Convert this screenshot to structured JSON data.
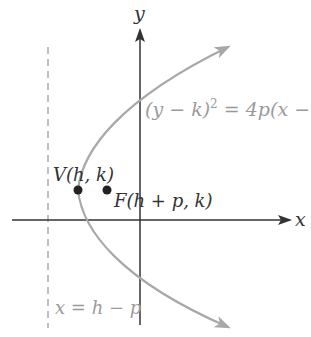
{
  "diagram": {
    "type": "parabola-horizontal-axis",
    "axes": {
      "x_label": "x",
      "y_label": "y"
    },
    "equation": {
      "lhs": "(y − k)",
      "exp": "2",
      "rhs": " = 4p(x − h"
    },
    "vertex": {
      "label": "V(h, k)"
    },
    "focus": {
      "label": "F(h + p, k)"
    },
    "directrix": {
      "label": "x = h − p"
    },
    "colors": {
      "axes": "#333333",
      "curve": "#a8a8a8",
      "directrix": "#a0a0a0",
      "points": "#222222",
      "equation_text": "#9a9a9a",
      "label_text": "#333333"
    }
  }
}
